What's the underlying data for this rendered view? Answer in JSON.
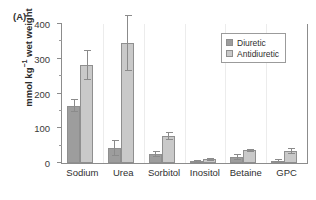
{
  "figure": {
    "panel_label": "(A)",
    "background_color": "#ffffff",
    "axis_color": "#8c8c8c"
  },
  "legend": {
    "position": "top-right-inside",
    "entries": [
      {
        "label": "Diuretic",
        "color": "#9d9d9d"
      },
      {
        "label": "Antidiuretic",
        "color": "#c9c9c9"
      }
    ]
  },
  "chart_data": {
    "type": "bar",
    "title": "",
    "subtitle": "",
    "xlabel": "",
    "ylabel": "mmol kg-1 wet weight",
    "ylabel_parts": {
      "pre": "mmol kg",
      "sup": "−1",
      "post": " wet weight"
    },
    "categories": [
      "Sodium",
      "Urea",
      "Sorbitol",
      "Inositol",
      "Betaine",
      "GPC"
    ],
    "ylim": [
      0,
      400
    ],
    "yticks": [
      0,
      100,
      200,
      300,
      400
    ],
    "ytick_labels": [
      "0",
      "100",
      "200",
      "300",
      "400"
    ],
    "yminor_ticks": [
      50,
      150,
      250,
      350
    ],
    "grid": false,
    "legend_position": "upper right",
    "series": [
      {
        "name": "Diuretic",
        "color": "#9d9d9d",
        "values": [
          165,
          43,
          26,
          4,
          17,
          6
        ],
        "errors": [
          18,
          22,
          7,
          2,
          7,
          3
        ]
      },
      {
        "name": "Antidiuretic",
        "color": "#c9c9c9",
        "values": [
          282,
          346,
          78,
          11,
          37,
          34
        ],
        "errors": [
          41,
          79,
          11,
          3,
          3,
          8
        ]
      }
    ]
  }
}
